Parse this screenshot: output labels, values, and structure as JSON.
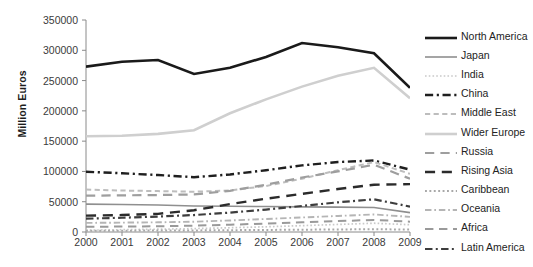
{
  "chart_data": {
    "type": "line",
    "title": "",
    "xlabel": "",
    "ylabel": "Million Euros",
    "categories": [
      "2000",
      "2001",
      "2002",
      "2003",
      "2004",
      "2005",
      "2006",
      "2007",
      "2008",
      "2009"
    ],
    "ylim": [
      0,
      350000
    ],
    "ytick_step": 50000,
    "yticks": [
      "0",
      "50000",
      "100000",
      "150000",
      "200000",
      "250000",
      "300000",
      "350000"
    ],
    "grid": false,
    "legend_position": "right",
    "series": [
      {
        "name": "North America",
        "color": "#1a1a1a",
        "style": "solid",
        "width": 2.6,
        "values": [
          273000,
          281000,
          284000,
          261000,
          271000,
          289000,
          312000,
          305000,
          295000,
          238000
        ]
      },
      {
        "name": "Japan",
        "color": "#8f8f8f",
        "style": "solid",
        "width": 1.6,
        "values": [
          46000,
          45500,
          44500,
          43000,
          42500,
          42000,
          41500,
          41000,
          40500,
          32000
        ]
      },
      {
        "name": "India",
        "color": "#c9c9c9",
        "style": "dotted",
        "width": 1.7,
        "values": [
          3000,
          3800,
          4600,
          5600,
          7000,
          8600,
          10500,
          12500,
          14500,
          12000
        ]
      },
      {
        "name": "China",
        "color": "#1f1f1f",
        "style": "dash-dot",
        "width": 2.4,
        "values": [
          99500,
          97000,
          94000,
          90500,
          95000,
          102000,
          110000,
          115500,
          118000,
          103000
        ]
      },
      {
        "name": "Middle East",
        "color": "#bdbdbd",
        "style": "dashed",
        "width": 2.0,
        "values": [
          70000,
          68500,
          67500,
          66500,
          68500,
          76000,
          88000,
          102000,
          115500,
          96000
        ]
      },
      {
        "name": "Wider Europe",
        "color": "#cfcfcf",
        "style": "solid",
        "width": 2.6,
        "values": [
          158000,
          159000,
          162000,
          168000,
          196000,
          219000,
          240000,
          258000,
          271000,
          221000
        ]
      },
      {
        "name": "Russia",
        "color": "#9e9e9e",
        "style": "long-dash",
        "width": 2.2,
        "values": [
          60000,
          60500,
          61000,
          62000,
          68000,
          78000,
          90000,
          100000,
          111000,
          88000
        ]
      },
      {
        "name": "Rising Asia",
        "color": "#2b2b2b",
        "style": "long-dash",
        "width": 2.4,
        "values": [
          27000,
          28000,
          30000,
          36000,
          46000,
          55000,
          63000,
          71000,
          78000,
          79000
        ]
      },
      {
        "name": "Caribbean",
        "color": "#a8a8a8",
        "style": "dotted",
        "width": 2.0,
        "values": [
          2000,
          2200,
          2400,
          2600,
          3000,
          3400,
          3800,
          4200,
          4600,
          4000
        ]
      },
      {
        "name": "Oceania",
        "color": "#b5b5b5",
        "style": "dash-dot",
        "width": 1.9,
        "values": [
          15000,
          15500,
          16000,
          17000,
          19000,
          21500,
          24000,
          26500,
          29000,
          25000
        ]
      },
      {
        "name": "Africa",
        "color": "#9a9a9a",
        "style": "long-dash",
        "width": 2.0,
        "values": [
          8500,
          9000,
          9500,
          10500,
          12000,
          14000,
          16000,
          18000,
          20000,
          17000
        ]
      },
      {
        "name": "Latin America",
        "color": "#3d3d3d",
        "style": "dash-dot",
        "width": 2.2,
        "values": [
          22000,
          23500,
          25500,
          28000,
          32000,
          37000,
          43000,
          49000,
          54000,
          42000
        ]
      }
    ]
  },
  "axes": {
    "y_title": "Million Euros"
  }
}
